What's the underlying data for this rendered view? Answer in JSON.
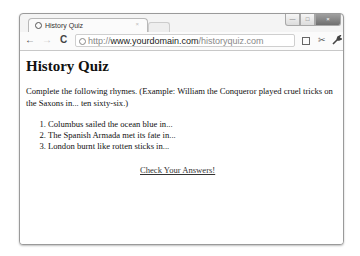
{
  "browser": {
    "tab": {
      "title": "History Quiz",
      "close_glyph": "×"
    },
    "window_controls": {
      "minimize": "—",
      "maximize": "□",
      "close": "×"
    },
    "toolbar": {
      "back_glyph": "←",
      "forward_glyph": "→",
      "reload_glyph": "C",
      "url": {
        "scheme": "http://",
        "host": "www.yourdomain.com",
        "path": "/historyquiz.com"
      },
      "tool_glyph": "✂",
      "wrench_glyph": "🔧"
    }
  },
  "page": {
    "title": "History Quiz",
    "intro": "Complete the following rhymes. (Example: William the Conqueror played cruel tricks on the Saxons in... ten sixty-six.)",
    "questions": [
      "Columbus sailed the ocean blue in...",
      "The Spanish Armada met its fate in...",
      "London burnt like rotten sticks in..."
    ],
    "check_link": "Check Your Answers!"
  }
}
